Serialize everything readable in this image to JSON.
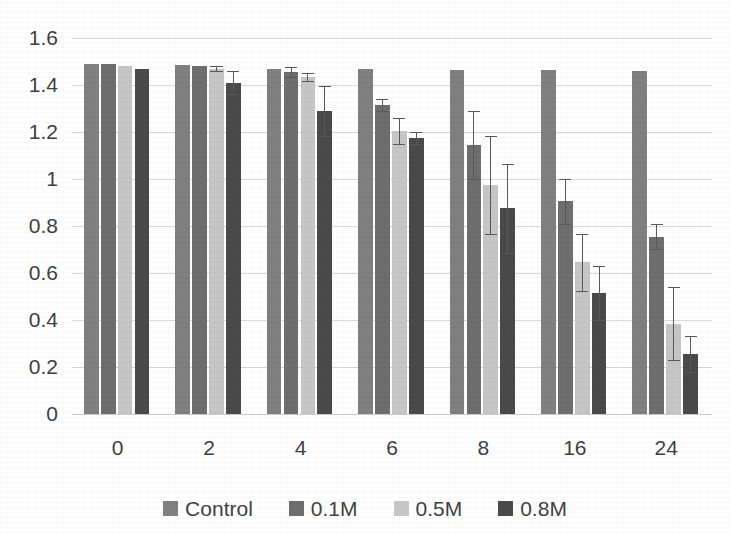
{
  "chart_data": {
    "type": "bar",
    "title": "",
    "subtitle": "",
    "xlabel": "",
    "ylabel": "",
    "categories": [
      "0",
      "2",
      "4",
      "6",
      "8",
      "16",
      "24"
    ],
    "ylim": [
      0,
      1.6
    ],
    "yticks": [
      "0",
      "0.2",
      "0.4",
      "0.6",
      "0.8",
      "1",
      "1.2",
      "1.4",
      "1.6"
    ],
    "ytick_values": [
      0,
      0.2,
      0.4,
      0.6,
      0.8,
      1.0,
      1.2,
      1.4,
      1.6
    ],
    "grid": true,
    "legend_position": "bottom",
    "orientation": "vertical",
    "series": [
      {
        "name": "Control",
        "color": "#808080",
        "values": [
          1.49,
          1.485,
          1.47,
          1.47,
          1.465,
          1.465,
          1.46
        ],
        "errors": [
          0,
          0,
          0,
          0,
          0,
          0,
          0
        ]
      },
      {
        "name": "0.1M",
        "color": "#6e6e6e",
        "values": [
          1.49,
          1.48,
          1.455,
          1.315,
          1.145,
          0.905,
          0.755
        ],
        "errors": [
          0,
          0,
          0.02,
          0.025,
          0.145,
          0.095,
          0.055
        ]
      },
      {
        "name": "0.5M",
        "color": "#c6c6c6",
        "values": [
          1.48,
          1.47,
          1.435,
          1.205,
          0.975,
          0.645,
          0.385
        ],
        "errors": [
          0,
          0.012,
          0.018,
          0.055,
          0.21,
          0.12,
          0.155
        ]
      },
      {
        "name": "0.8M",
        "color": "#4a4a4a",
        "values": [
          1.47,
          1.41,
          1.29,
          1.175,
          0.875,
          0.515,
          0.255
        ],
        "errors": [
          0,
          0.05,
          0.105,
          0.025,
          0.19,
          0.115,
          0.075
        ]
      }
    ]
  },
  "legend": {
    "items": [
      {
        "label": "Control",
        "color": "#808080"
      },
      {
        "label": "0.1M",
        "color": "#6e6e6e"
      },
      {
        "label": "0.5M",
        "color": "#c6c6c6"
      },
      {
        "label": "0.8M",
        "color": "#4a4a4a"
      }
    ]
  }
}
